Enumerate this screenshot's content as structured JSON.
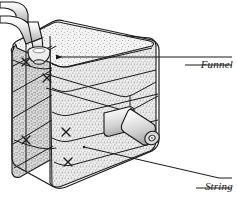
{
  "figure": {
    "type": "technical-line-illustration",
    "background_color": "#ffffff",
    "ink_color": "#1a1a1a",
    "texture_color": "#9a9a9a",
    "tube_fill": "#d8d8d8",
    "block_fill": "#e8e8e8"
  },
  "labels": [
    {
      "id": "funnel",
      "text": "Funnel",
      "leader": "horizontal line with left arrowhead pointing to the funnel cup on the top face"
    },
    {
      "id": "string",
      "text": "String",
      "leader": "diagonal line rising to the left, pointing to the string on the front lower layer"
    }
  ],
  "parts": {
    "funnel_label": "Funnel",
    "string_label": "String",
    "tube_name": "inlet-tube",
    "nozzle_name": "outlet-nozzle",
    "block_name": "layered-block"
  }
}
